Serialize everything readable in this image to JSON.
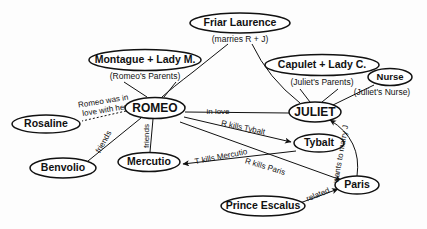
{
  "diagram": {
    "background": "#fdfdfd",
    "ink": "#111111",
    "nodes": [
      {
        "id": "friar",
        "label": "Friar Laurence",
        "cx": 240,
        "cy": 23,
        "rx": 50,
        "ry": 10,
        "fontsize": 10.5
      },
      {
        "id": "montague",
        "label": "Montague + Lady M.",
        "cx": 145,
        "cy": 60,
        "rx": 56,
        "ry": 10.5,
        "fontsize": 10.5
      },
      {
        "id": "capulet",
        "label": "Capulet + Lady C.",
        "cx": 322,
        "cy": 65,
        "rx": 57,
        "ry": 10.5,
        "fontsize": 10.5
      },
      {
        "id": "nurse",
        "label": "Nurse",
        "cx": 390,
        "cy": 77,
        "rx": 22,
        "ry": 8.5,
        "fontsize": 9.5
      },
      {
        "id": "romeo",
        "label": "ROMEO",
        "cx": 155,
        "cy": 108,
        "rx": 30,
        "ry": 10.5,
        "fontsize": 12
      },
      {
        "id": "juliet",
        "label": "JULIET",
        "cx": 315,
        "cy": 112,
        "rx": 26,
        "ry": 10,
        "fontsize": 12
      },
      {
        "id": "rosaline",
        "label": "Rosaline",
        "cx": 46,
        "cy": 124,
        "rx": 34,
        "ry": 9,
        "fontsize": 10.5
      },
      {
        "id": "benvolio",
        "label": "Benvolio",
        "cx": 63,
        "cy": 168,
        "rx": 33,
        "ry": 10,
        "fontsize": 10.5
      },
      {
        "id": "mercutio",
        "label": "Mercutio",
        "cx": 149,
        "cy": 162,
        "rx": 31,
        "ry": 9.5,
        "fontsize": 10.5
      },
      {
        "id": "tybalt",
        "label": "Tybalt",
        "cx": 319,
        "cy": 143,
        "rx": 25,
        "ry": 9,
        "fontsize": 10.5
      },
      {
        "id": "paris",
        "label": "Paris",
        "cx": 357,
        "cy": 185,
        "rx": 22,
        "ry": 9,
        "fontsize": 10.5
      },
      {
        "id": "prince",
        "label": "Prince Escalus",
        "cx": 263,
        "cy": 206,
        "rx": 42,
        "ry": 10,
        "fontsize": 10.5
      }
    ],
    "sublabels": [
      {
        "id": "friar-sub",
        "text": "(marries  R + J)",
        "x": 240,
        "cy": 40,
        "fontsize": 9
      },
      {
        "id": "montague-sub",
        "text": "(Romeo's Parents)",
        "x": 145,
        "cy": 77,
        "fontsize": 9
      },
      {
        "id": "capulet-sub",
        "text": "(Juliet's Parents)",
        "x": 322,
        "cy": 83,
        "fontsize": 9
      },
      {
        "id": "nurse-sub",
        "text": "(Juliet's Nurse)",
        "x": 382,
        "cy": 93,
        "fontsize": 9
      }
    ],
    "edge_labels": [
      {
        "id": "romeo-loved-rosaline",
        "line1": "Romeo was in",
        "line2": "love with her",
        "x": 104,
        "y": 106,
        "rotate": -9,
        "fontsize": 7.5
      },
      {
        "id": "romeo-benvolio",
        "line1": "friends",
        "line2": "",
        "x": 104,
        "y": 142,
        "rotate": -61,
        "fontsize": 8
      },
      {
        "id": "romeo-mercutio",
        "line1": "friends",
        "line2": "",
        "x": 147,
        "y": 136,
        "rotate": -90,
        "fontsize": 8
      },
      {
        "id": "romeo-juliet-love",
        "line1": "in love",
        "line2": "",
        "x": 218,
        "y": 112,
        "rotate": 0,
        "fontsize": 8.5
      },
      {
        "id": "romeo-kills-tybalt",
        "line1": "R kills Tybalt",
        "line2": "",
        "x": 243,
        "y": 128,
        "rotate": 12,
        "fontsize": 8.5
      },
      {
        "id": "tybalt-kills-mercutio",
        "line1": "T kills Mercutio",
        "line2": "",
        "x": 221,
        "y": 157,
        "rotate": -11,
        "fontsize": 8.5
      },
      {
        "id": "romeo-kills-paris",
        "line1": "R kills Paris",
        "line2": "",
        "x": 265,
        "y": 167,
        "rotate": 17,
        "fontsize": 8.5
      },
      {
        "id": "paris-wants-juliet",
        "line1": "wants to marry J",
        "line2": "",
        "x": 341,
        "y": 154,
        "rotate": -80,
        "fontsize": 7.5
      },
      {
        "id": "prince-paris-related",
        "line1": "related",
        "line2": "",
        "x": 318,
        "y": 195,
        "rotate": -22,
        "fontsize": 8.5
      }
    ],
    "relationships": [
      {
        "from": "friar",
        "to": "romeo",
        "label": "marries R + J"
      },
      {
        "from": "friar",
        "to": "juliet",
        "label": "marries R + J"
      },
      {
        "from": "montague",
        "to": "romeo",
        "label": "Romeo's Parents"
      },
      {
        "from": "capulet",
        "to": "juliet",
        "label": "Juliet's Parents"
      },
      {
        "from": "nurse",
        "to": "juliet",
        "label": "Juliet's Nurse"
      },
      {
        "from": "romeo",
        "to": "rosaline",
        "label": "Romeo was in love with her"
      },
      {
        "from": "romeo",
        "to": "benvolio",
        "label": "friends"
      },
      {
        "from": "romeo",
        "to": "mercutio",
        "label": "friends"
      },
      {
        "from": "romeo",
        "to": "juliet",
        "label": "in love"
      },
      {
        "from": "romeo",
        "to": "tybalt",
        "label": "R kills Tybalt"
      },
      {
        "from": "tybalt",
        "to": "mercutio",
        "label": "T kills Mercutio"
      },
      {
        "from": "romeo",
        "to": "paris",
        "label": "R kills Paris"
      },
      {
        "from": "paris",
        "to": "juliet",
        "label": "wants to marry J"
      },
      {
        "from": "prince",
        "to": "paris",
        "label": "related"
      }
    ]
  }
}
